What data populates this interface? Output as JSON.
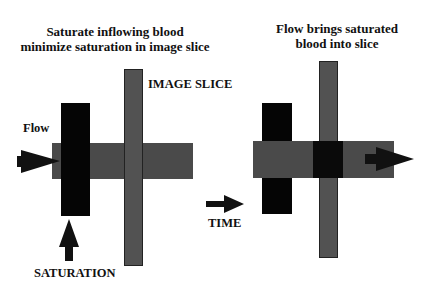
{
  "left_panel": {
    "title_line1": "Saturate inflowing blood",
    "title_line2": "minimize saturation in image slice",
    "flow_label": "Flow",
    "image_slice_label": "IMAGE SLICE",
    "saturation_label": "SATURATION"
  },
  "middle": {
    "time_label": "TIME"
  },
  "right_panel": {
    "title_line1": "Flow brings saturated",
    "title_line2": "blood into slice"
  },
  "colors": {
    "vessel": "#4a4a4a",
    "slice": "#505050",
    "saturation": "#050505",
    "overlap_dark": "#0a0a0a",
    "text": "#111111"
  }
}
